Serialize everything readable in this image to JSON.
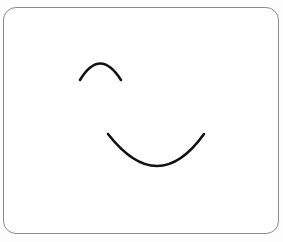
{
  "figure": {
    "frame": {
      "x": 3,
      "y": 7,
      "width": 275,
      "height": 226,
      "corner_radius": 13,
      "stroke_color": "#8a8a8a"
    },
    "curves": [
      {
        "name": "upper-arch",
        "shape": "concave-down arc",
        "start": [
          80,
          80
        ],
        "peak": [
          100,
          63
        ],
        "end": [
          121,
          80
        ],
        "stroke_color": "#111111",
        "stroke_width": 2.6
      },
      {
        "name": "lower-smile",
        "shape": "concave-up arc",
        "start": [
          108,
          134
        ],
        "trough": [
          160,
          167
        ],
        "end": [
          204,
          134
        ],
        "stroke_color": "#111111",
        "stroke_width": 2.6
      }
    ]
  }
}
